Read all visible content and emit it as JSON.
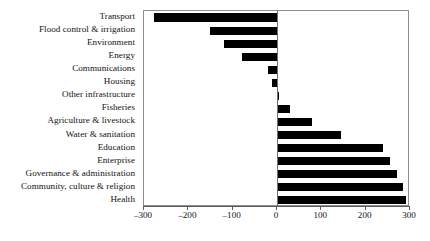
{
  "chart_data": {
    "type": "bar",
    "orientation": "horizontal",
    "title": "",
    "subtitle": "",
    "xlabel": "",
    "ylabel": "",
    "xlim": [
      -300,
      300
    ],
    "xticks": [
      -300,
      -200,
      -100,
      0,
      100,
      200,
      300
    ],
    "xtick_labels": [
      "–300",
      "–200",
      "–100",
      "0",
      "100",
      "200",
      "300"
    ],
    "grid": false,
    "legend": null,
    "bar_color": "#000000",
    "frame_color": "#8d8d8d",
    "categories": [
      "Transport",
      "Flood control & irrigation",
      "Environment",
      "Energy",
      "Communications",
      "Housing",
      "Other infrastructure",
      "Fisheries",
      "Agriculture & livestock",
      "Water & sanitation",
      "Education",
      "Enterprise",
      "Governance & administration",
      "Community, culture & religion",
      "Health"
    ],
    "values": [
      -277,
      -152,
      -119,
      -78,
      -20,
      -12,
      5,
      30,
      80,
      145,
      240,
      255,
      270,
      285,
      290
    ]
  }
}
